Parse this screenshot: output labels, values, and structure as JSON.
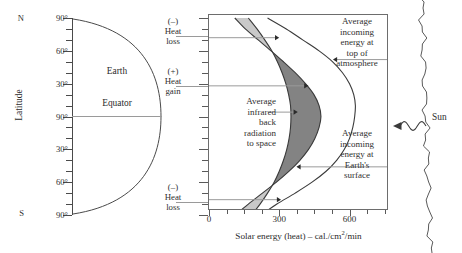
{
  "figure": {
    "type": "scientific-diagram"
  },
  "left_panel": {
    "axis_title": "Latitude",
    "hemisphere_markers": {
      "north": "N",
      "south": "S"
    },
    "tick_labels": [
      "90°",
      "60°",
      "30°",
      "90°",
      "30°",
      "60°",
      "90°"
    ],
    "earth_label": "Earth",
    "equator_label": "Equator"
  },
  "heat_annotations": [
    {
      "sign": "(–)",
      "line1": "Heat",
      "line2": "loss"
    },
    {
      "sign": "(+)",
      "line1": "Heat",
      "line2": "gain"
    },
    {
      "sign": "(–)",
      "line1": "Heat",
      "line2": "loss"
    }
  ],
  "chart_annotations": {
    "infrared": "Average\ninfrared\nback\nradiation\nto space",
    "top_of_atmosphere": "Average\nincoming\nenergy at\ntop of\natmosphere",
    "earth_surface": "Average\nincoming\nenergy at\nEarth's\nsurface"
  },
  "sun": {
    "label": "Sun"
  },
  "chart_data": {
    "type": "line",
    "title": "",
    "xlabel": "Solar energy (heat) – cal./cm²/min",
    "ylabel": "Latitude",
    "xlim": [
      0,
      760
    ],
    "ylim_latitude": [
      90,
      -90
    ],
    "xticks": [
      0,
      300,
      600
    ],
    "xtick_labels": [
      "0",
      "300",
      "600"
    ],
    "xminor_ticks": [
      75,
      150,
      225,
      375,
      450,
      525,
      675,
      750
    ],
    "grid": false,
    "legend": "none",
    "latitudes": [
      90,
      80,
      70,
      60,
      50,
      40,
      30,
      20,
      10,
      0,
      -10,
      -20,
      -30,
      -40,
      -50,
      -60,
      -70,
      -80,
      -90
    ],
    "series": [
      {
        "name": "Average incoming energy at top of atmosphere",
        "values": [
          250,
          330,
          400,
          470,
          528,
          570,
          600,
          618,
          625,
          622,
          614,
          600,
          578,
          545,
          500,
          440,
          368,
          290,
          222
        ]
      },
      {
        "name": "Average incoming energy at Earth's surface",
        "values": [
          110,
          155,
          210,
          265,
          318,
          368,
          412,
          448,
          470,
          478,
          470,
          452,
          425,
          388,
          342,
          288,
          228,
          168,
          112
        ]
      },
      {
        "name": "Average infrared back radiation to space",
        "values": [
          168,
          205,
          238,
          268,
          292,
          312,
          328,
          340,
          348,
          350,
          348,
          342,
          332,
          318,
          300,
          278,
          250,
          218,
          182
        ]
      }
    ],
    "regions": [
      {
        "name": "heat-loss-north",
        "sign": "negative",
        "fill": "#c9c9c9",
        "latitude_range": [
          90,
          38
        ]
      },
      {
        "name": "heat-gain-tropics",
        "sign": "positive",
        "fill": "#838383",
        "latitude_range": [
          38,
          -38
        ]
      },
      {
        "name": "heat-loss-south",
        "sign": "negative",
        "fill": "#c9c9c9",
        "latitude_range": [
          -38,
          -90
        ]
      }
    ]
  },
  "colors": {
    "heat_loss_fill": "#c9c9c9",
    "heat_gain_fill": "#838383",
    "curve_stroke": "#3a3a3a",
    "frame": "#6d6d6d",
    "leader": "#9a9a9a"
  }
}
